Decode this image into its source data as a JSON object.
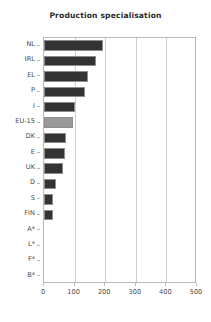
{
  "chart_data": {
    "type": "bar",
    "orientation": "horizontal",
    "title": "Production specialisation",
    "xlabel": "",
    "ylabel": "",
    "categories": [
      "NL",
      "IRL",
      "EL",
      "P",
      "I",
      "EU-15",
      "DK",
      "E",
      "UK",
      "D",
      "S",
      "FIN",
      "A*",
      "L*",
      "F*",
      "B*"
    ],
    "values": [
      193,
      169,
      144,
      133,
      100,
      96,
      72,
      69,
      62,
      40,
      28,
      28,
      0,
      0,
      0,
      0
    ],
    "xlim": [
      0,
      500
    ],
    "xticks": [
      0,
      100,
      200,
      300,
      400,
      500
    ],
    "xtick_labels": [
      "0",
      "100",
      "200",
      "300",
      "400",
      "500"
    ],
    "grid": "vertical",
    "legend": "none",
    "highlight_category": "EU-15",
    "bar_color": "#333333",
    "highlight_color": "#9a9a9a",
    "gridline_color": "#cfcfcf",
    "frame_color": "#b9b9b9"
  },
  "footer": {
    "caption": ""
  }
}
